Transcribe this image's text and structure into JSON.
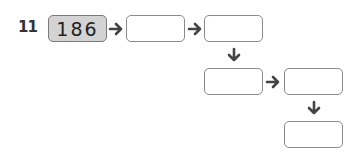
{
  "problem": {
    "number": "11",
    "start_value": "186",
    "boxes": [
      "",
      "",
      "",
      "",
      ""
    ],
    "arrows": [
      "right",
      "right",
      "down",
      "right",
      "down"
    ],
    "colors": {
      "filled_box": "#d3d3d3",
      "border": "#8a8a8a",
      "arrow": "#444444"
    }
  }
}
